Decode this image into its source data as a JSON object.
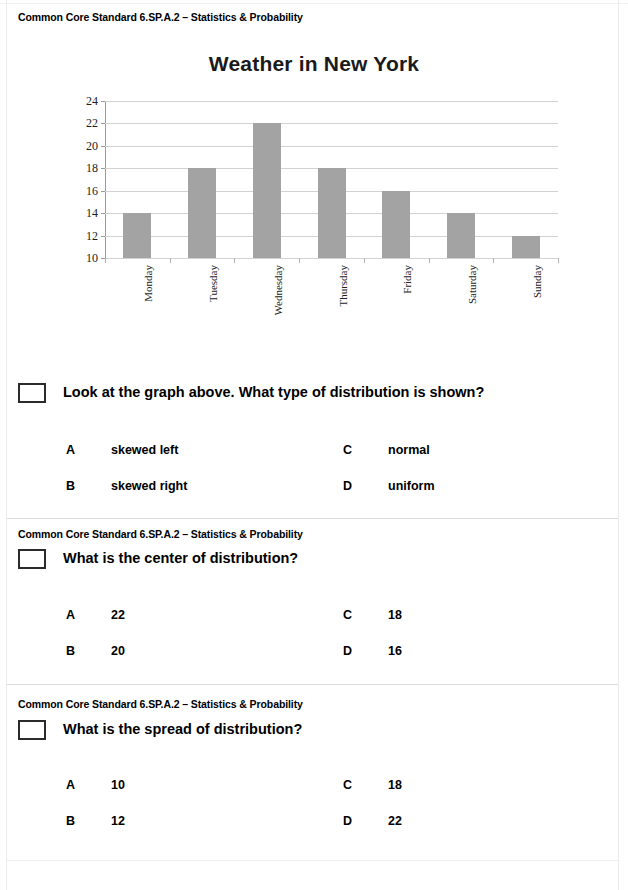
{
  "page": {
    "standard_label": "Common Core Standard 6.SP.A.2 – Statistics & Probability"
  },
  "chart_data": {
    "type": "bar",
    "title": "Weather in New York",
    "xlabel": "",
    "ylabel": "Temperature (Celsius degrees)",
    "categories": [
      "Monday",
      "Tuesday",
      "Wednesday",
      "Thursday",
      "Friday",
      "Saturday",
      "Sunday"
    ],
    "values": [
      14,
      18,
      22,
      18,
      16,
      14,
      12
    ],
    "ylim": [
      10,
      24
    ],
    "ytick_labels": [
      "10",
      "12",
      "14",
      "16",
      "18",
      "20",
      "22",
      "24"
    ],
    "ytick_values": [
      10,
      12,
      14,
      16,
      18,
      20,
      22,
      24
    ],
    "grid": true,
    "legend": "none",
    "bar_color": "#a3a3a3",
    "grid_color": "#d2d2d2"
  },
  "questions": [
    {
      "standard": "Common Core Standard 6.SP.A.2 – Statistics & Probability",
      "prompt": "Look at the graph above. What type of distribution is shown?",
      "options": [
        {
          "letter": "A",
          "text": "skewed left"
        },
        {
          "letter": "B",
          "text": "skewed right"
        },
        {
          "letter": "C",
          "text": "normal"
        },
        {
          "letter": "D",
          "text": "uniform"
        }
      ]
    },
    {
      "standard": "Common Core Standard 6.SP.A.2 – Statistics & Probability",
      "prompt": "What is the center of distribution?",
      "options": [
        {
          "letter": "A",
          "text": "22"
        },
        {
          "letter": "B",
          "text": "20"
        },
        {
          "letter": "C",
          "text": "18"
        },
        {
          "letter": "D",
          "text": "16"
        }
      ]
    },
    {
      "standard": "Common Core Standard 6.SP.A.2 – Statistics & Probability",
      "prompt": "What is the spread of distribution?",
      "options": [
        {
          "letter": "A",
          "text": "10"
        },
        {
          "letter": "B",
          "text": "12"
        },
        {
          "letter": "C",
          "text": "18"
        },
        {
          "letter": "D",
          "text": "22"
        }
      ]
    }
  ]
}
